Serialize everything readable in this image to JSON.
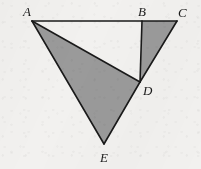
{
  "figure": {
    "name": "triangle-diagram-abcde",
    "canvas": {
      "width": 201,
      "height": 169
    },
    "background_color": "#f2f1ef",
    "stroke_color": "#1a1a1a",
    "shade_color": "#9a9a9a",
    "stroke_width": 1.6,
    "points": {
      "A": {
        "x": 32,
        "y": 21
      },
      "B": {
        "x": 142,
        "y": 21
      },
      "C": {
        "x": 177,
        "y": 21
      },
      "D": {
        "x": 140,
        "y": 82
      },
      "E": {
        "x": 104,
        "y": 144
      }
    },
    "shaded_regions": [
      {
        "id": "triangle-ade",
        "vertices": "A,D,E",
        "filled": true
      },
      {
        "id": "triangle-bcd",
        "vertices": "B,C,D",
        "filled": true
      }
    ],
    "unshaded_regions": [
      {
        "id": "triangle-abd",
        "vertices": "A,B,D",
        "filled": false
      }
    ],
    "segments": [
      {
        "id": "segment-ac",
        "from": "A",
        "to": "C"
      },
      {
        "id": "segment-bd",
        "from": "B",
        "to": "D"
      },
      {
        "id": "segment-cd",
        "from": "C",
        "to": "D"
      },
      {
        "id": "segment-ad",
        "from": "A",
        "to": "D"
      },
      {
        "id": "segment-ae",
        "from": "A",
        "to": "E"
      },
      {
        "id": "segment-de",
        "from": "D",
        "to": "E"
      }
    ],
    "labels": [
      {
        "id": "label-a",
        "text": "A",
        "x": 23,
        "y": 5
      },
      {
        "id": "label-b",
        "text": "B",
        "x": 138,
        "y": 5
      },
      {
        "id": "label-c",
        "text": "C",
        "x": 178,
        "y": 6
      },
      {
        "id": "label-d",
        "text": "D",
        "x": 143,
        "y": 84
      },
      {
        "id": "label-e",
        "text": "E",
        "x": 100,
        "y": 151
      }
    ]
  }
}
